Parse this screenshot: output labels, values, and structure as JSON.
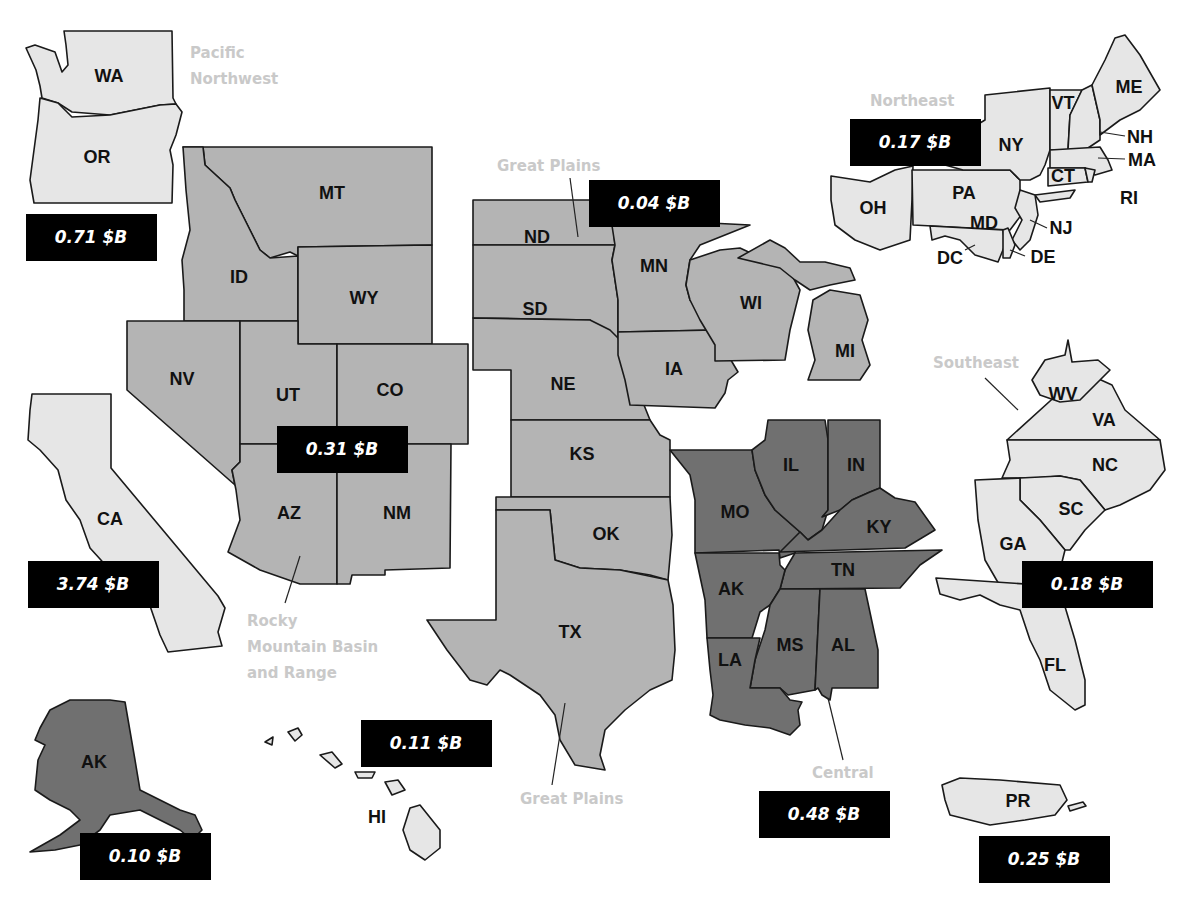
{
  "unit_suffix": "$B",
  "legend_fills": {
    "light": "#e6e6e6",
    "mid": "#b4b4b4",
    "dark": "#707070",
    "badge": "#000000",
    "region_label": "#c9c9c9"
  },
  "regions": [
    {
      "key": "pnw",
      "name": "Pacific Northwest",
      "value_label": "0.71 $B",
      "value": 0.71,
      "shade": "light",
      "states": [
        "WA",
        "OR"
      ]
    },
    {
      "key": "ca",
      "name": "",
      "value_label": "3.74 $B",
      "value": 3.74,
      "shade": "light",
      "states": [
        "CA"
      ]
    },
    {
      "key": "rocky",
      "name": "Rocky Mountain Basin and Range",
      "value_label": "0.31 $B",
      "value": 0.31,
      "shade": "mid",
      "states": [
        "MT",
        "ID",
        "WY",
        "NV",
        "UT",
        "CO",
        "AZ",
        "NM"
      ]
    },
    {
      "key": "plains",
      "name": "Great Plains",
      "value_label": "0.04 $B",
      "value": 0.04,
      "shade": "mid",
      "states": [
        "ND",
        "SD",
        "NE",
        "KS",
        "OK",
        "TX",
        "MN",
        "IA",
        "WI",
        "MI"
      ]
    },
    {
      "key": "northeast",
      "name": "Northeast",
      "value_label": "0.17 $B",
      "value": 0.17,
      "shade": "light",
      "states": [
        "ME",
        "VT",
        "NH",
        "MA",
        "NY",
        "CT",
        "RI",
        "PA",
        "NJ",
        "OH",
        "MD",
        "DE",
        "DC"
      ]
    },
    {
      "key": "southeast",
      "name": "Southeast",
      "value_label": "0.18 $B",
      "value": 0.18,
      "shade": "light",
      "states": [
        "WV",
        "VA",
        "NC",
        "SC",
        "GA",
        "FL"
      ]
    },
    {
      "key": "central",
      "name": "Central",
      "value_label": "0.48 $B",
      "value": 0.48,
      "shade": "dark",
      "states": [
        "MO",
        "IL",
        "IN",
        "KY",
        "TN",
        "AK",
        "MS",
        "AL",
        "LA"
      ]
    },
    {
      "key": "alaska",
      "name": "",
      "value_label": "0.10 $B",
      "value": 0.1,
      "shade": "dark",
      "states": [
        "AK"
      ]
    },
    {
      "key": "hawaii",
      "name": "",
      "value_label": "0.11 $B",
      "value": 0.11,
      "shade": "light",
      "states": [
        "HI"
      ]
    },
    {
      "key": "pr",
      "name": "",
      "value_label": "0.25 $B",
      "value": 0.25,
      "shade": "light",
      "states": [
        "PR"
      ]
    }
  ],
  "region_labels": {
    "pnw_line1": "Pacific",
    "pnw_line2": "Northwest",
    "plains_top": "Great Plains",
    "plains_bottom": "Great Plains",
    "rocky_line1": "Rocky",
    "rocky_line2": "Mountain Basin",
    "rocky_line3": "and Range",
    "northeast": "Northeast",
    "southeast": "Southeast",
    "central": "Central"
  },
  "badges": {
    "pnw": "0.71 $B",
    "ca": "3.74 $B",
    "rocky": "0.31 $B",
    "plains": "0.04 $B",
    "northeast": "0.17 $B",
    "southeast": "0.18 $B",
    "central": "0.48 $B",
    "alaska": "0.10 $B",
    "hawaii": "0.11 $B",
    "pr": "0.25 $B"
  },
  "state_labels": {
    "WA": "WA",
    "OR": "OR",
    "CA": "CA",
    "MT": "MT",
    "ID": "ID",
    "WY": "WY",
    "NV": "NV",
    "UT": "UT",
    "CO": "CO",
    "AZ": "AZ",
    "NM": "NM",
    "ND": "ND",
    "SD": "SD",
    "NE": "NE",
    "KS": "KS",
    "OK": "OK",
    "TX": "TX",
    "MN": "MN",
    "IA": "IA",
    "WI": "WI",
    "MI": "MI",
    "MO": "MO",
    "IL": "IL",
    "IN": "IN",
    "KY": "KY",
    "TN": "TN",
    "AR": "AK",
    "MS": "MS",
    "AL": "AL",
    "LA": "LA",
    "OH": "OH",
    "PA": "PA",
    "NY": "NY",
    "VT": "VT",
    "NH": "NH",
    "ME": "ME",
    "MA": "MA",
    "CT": "CT",
    "RI": "RI",
    "NJ": "NJ",
    "MD": "MD",
    "DE": "DE",
    "DC": "DC",
    "WV": "WV",
    "VA": "VA",
    "NC": "NC",
    "SC": "SC",
    "GA": "GA",
    "FL": "FL",
    "AK": "AK",
    "HI": "HI",
    "PR": "PR"
  }
}
